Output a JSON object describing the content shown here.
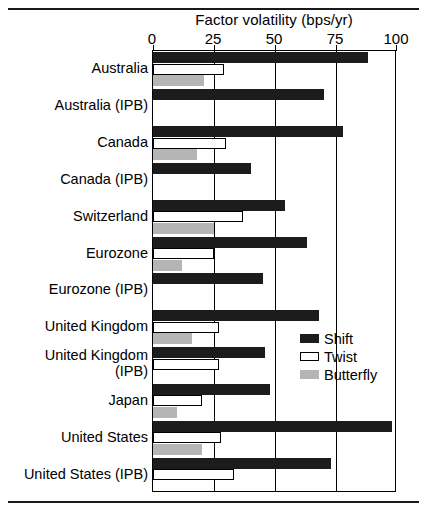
{
  "chart_data": {
    "type": "bar",
    "orientation": "horizontal",
    "title": "Factor volatility (bps/yr)",
    "xlabel": "",
    "ylabel": "",
    "xlim": [
      0,
      100
    ],
    "xticks": [
      0,
      25,
      50,
      75,
      100
    ],
    "xtick_labels": [
      "0",
      "25",
      "50",
      "75",
      "100"
    ],
    "grid": true,
    "legend_position": "inside-right",
    "categories": [
      "Australia",
      "Australia (IPB)",
      "Canada",
      "Canada (IPB)",
      "Switzerland",
      "Eurozone",
      "Eurozone (IPB)",
      "United Kingdom",
      "United Kingdom (IPB)",
      "Japan",
      "United States",
      "United States (IPB)"
    ],
    "series": [
      {
        "name": "Shift",
        "color": "#1c1c1c",
        "values": [
          88,
          70,
          78,
          40,
          54,
          63,
          45,
          68,
          46,
          48,
          98,
          73
        ]
      },
      {
        "name": "Twist",
        "color": "#ffffff",
        "values": [
          29,
          0,
          30,
          0,
          37,
          25,
          0,
          27,
          27,
          20,
          28,
          33
        ]
      },
      {
        "name": "Butterfly",
        "color": "#b5b5b5",
        "values": [
          21,
          0,
          18,
          0,
          25,
          12,
          0,
          16,
          0,
          10,
          20,
          0
        ]
      }
    ]
  },
  "legend": {
    "entries": [
      {
        "label": "Shift",
        "swatch": "shift"
      },
      {
        "label": "Twist",
        "swatch": "twist"
      },
      {
        "label": "Butterfly",
        "swatch": "butterfly"
      }
    ]
  }
}
